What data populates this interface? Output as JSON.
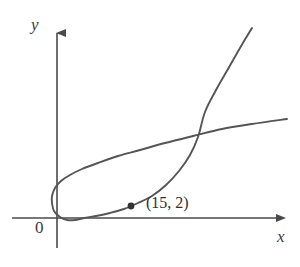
{
  "figure": {
    "kind": "parametric-curve-plot",
    "background_color": "#ffffff",
    "axis_color": "#4a4a4a",
    "curve_color": "#555555",
    "point_color": "#333333",
    "text_color": "#2e2e2e"
  },
  "axes": {
    "x_label": "x",
    "y_label": "y",
    "origin_label": "0",
    "x_axis": {
      "y_px": 218,
      "x_start_px": 12,
      "x_end_px": 283,
      "arrow": "right"
    },
    "y_axis": {
      "x_px": 57,
      "y_start_px": 248,
      "y_end_px": 25,
      "arrow": "up"
    }
  },
  "annotations": {
    "point": {
      "label": "(15, 2)",
      "marker": "filled-dot",
      "x_px": 131,
      "y_px": 206,
      "data_x": 15,
      "data_y": 2
    }
  },
  "chart_data": {
    "type": "line",
    "title": "",
    "xlabel": "x",
    "ylabel": "y",
    "grid": false,
    "legend": false,
    "annotations": [
      {
        "text": "(15, 2)",
        "x": 15,
        "y": 2,
        "marker": true
      },
      {
        "text": "0",
        "x": 0,
        "y": 0,
        "marker": false
      }
    ],
    "series": [
      {
        "name": "looped-parametric-curve",
        "comment": "Self-intersecting loop curve drawn in screen pixel coordinates",
        "points_px": [
          [
            252,
            28
          ],
          [
            240,
            48
          ],
          [
            228,
            69
          ],
          [
            216,
            90
          ],
          [
            205,
            112
          ],
          [
            198,
            137
          ],
          [
            190,
            155
          ],
          [
            179,
            171
          ],
          [
            166,
            185
          ],
          [
            152,
            196
          ],
          [
            138,
            203
          ],
          [
            124,
            209
          ],
          [
            110,
            213
          ],
          [
            96,
            216
          ],
          [
            84,
            218
          ],
          [
            75,
            220
          ],
          [
            67,
            220
          ],
          [
            60,
            217
          ],
          [
            54,
            211
          ],
          [
            52,
            203
          ],
          [
            52,
            196
          ],
          [
            55,
            188
          ],
          [
            61,
            181
          ],
          [
            70,
            175
          ],
          [
            82,
            169
          ],
          [
            98,
            163
          ],
          [
            118,
            156
          ],
          [
            140,
            150
          ],
          [
            165,
            143
          ],
          [
            193,
            136
          ],
          [
            222,
            129
          ],
          [
            252,
            124
          ],
          [
            287,
            119
          ]
        ]
      }
    ]
  }
}
